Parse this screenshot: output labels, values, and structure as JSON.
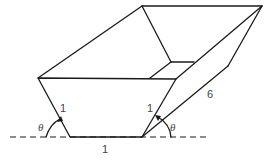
{
  "diagram": {
    "labels": {
      "left_side": "1",
      "right_side": "1",
      "bottom": "1",
      "length": "6",
      "angle_left": "θ",
      "angle_right": "θ"
    },
    "colors": {
      "line": "#1a1a1a",
      "text": "#444444",
      "background": "#ffffff"
    }
  }
}
